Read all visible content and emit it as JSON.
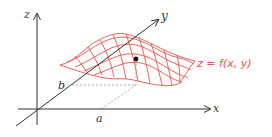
{
  "diagram": {
    "colors": {
      "axis": "#333333",
      "surface": "#e8524a",
      "point": "#111111",
      "dashed": "#999999"
    },
    "axes": {
      "x_label": "x",
      "y_label": "y",
      "z_label": "z"
    },
    "markers": {
      "a_label": "a",
      "b_label": "b"
    },
    "surface_label": "z = f(x,  y)"
  }
}
